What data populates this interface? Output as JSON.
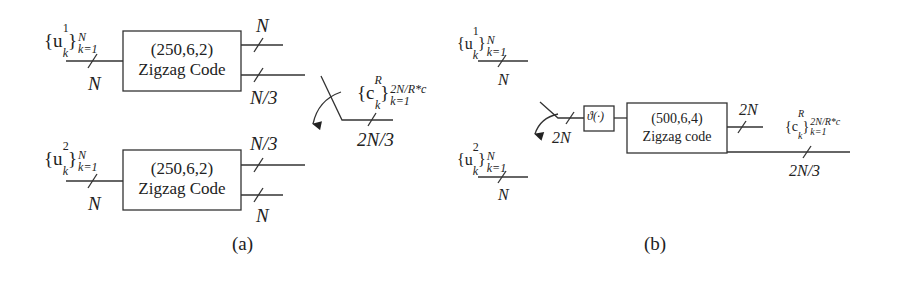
{
  "diagram_a": {
    "caption": "(a)",
    "encoder_top": {
      "input_set": {
        "base": "{u",
        "sup": "1",
        "sub": "k",
        "close": "}",
        "upper": "N",
        "lower": "k=1"
      },
      "input_width": "N",
      "params": "(250,6,2)",
      "name": "Zigzag Code",
      "output_upper_width": "N",
      "output_lower_width": "N/3"
    },
    "encoder_bottom": {
      "input_set": {
        "base": "{u",
        "sup": "2",
        "sub": "k",
        "close": "}",
        "upper": "N",
        "lower": "k=1"
      },
      "input_width": "N",
      "params": "(250,6,2)",
      "name": "Zigzag Code",
      "output_upper_width": "N/3",
      "output_lower_width": "N"
    },
    "switch_output": {
      "set": {
        "base": "{c",
        "sup": "R",
        "sub": "k",
        "close": "}",
        "upper": "2N/R*c",
        "lower": "k=1"
      },
      "width": "2N/3"
    }
  },
  "diagram_b": {
    "caption": "(b)",
    "input1": {
      "base": "{u",
      "sup": "1",
      "sub": "k",
      "close": "}",
      "upper": "N",
      "lower": "k=1",
      "width": "N"
    },
    "input2": {
      "base": "{u",
      "sup": "2",
      "sub": "k",
      "close": "}",
      "upper": "N",
      "lower": "k=1",
      "width": "N"
    },
    "switch_width": "2N",
    "interleaver": "ϑ(·)",
    "encoder": {
      "params": "(500,6,4)",
      "name": "Zigzag code",
      "output_upper_width": "2N",
      "output_lower_width": "2N/3"
    },
    "output_set": {
      "base": "{c",
      "sup": "R",
      "sub": "k",
      "close": "}",
      "upper": "2N/R*c",
      "lower": "k=1"
    }
  }
}
